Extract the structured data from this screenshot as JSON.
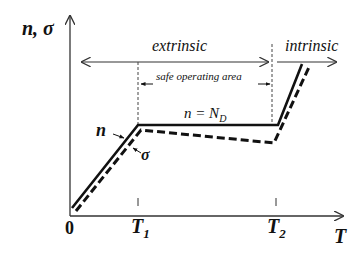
{
  "diagram": {
    "y_axis_label": "n, σ",
    "x_axis_label": "T",
    "origin_label": "0",
    "ticks": [
      {
        "base": "T",
        "sub": "1"
      },
      {
        "base": "T",
        "sub": "2"
      }
    ],
    "regions": {
      "extrinsic": "extrinsic",
      "intrinsic": "intrinsic",
      "safe_area": "safe operating area"
    },
    "plateau_label": {
      "lhs": "n = N",
      "sub": "D"
    },
    "curve_labels": {
      "n": "n",
      "sigma": "σ"
    },
    "colors": {
      "line": "#111111",
      "axis": "#333333",
      "dashed_guide": "#444444"
    }
  }
}
